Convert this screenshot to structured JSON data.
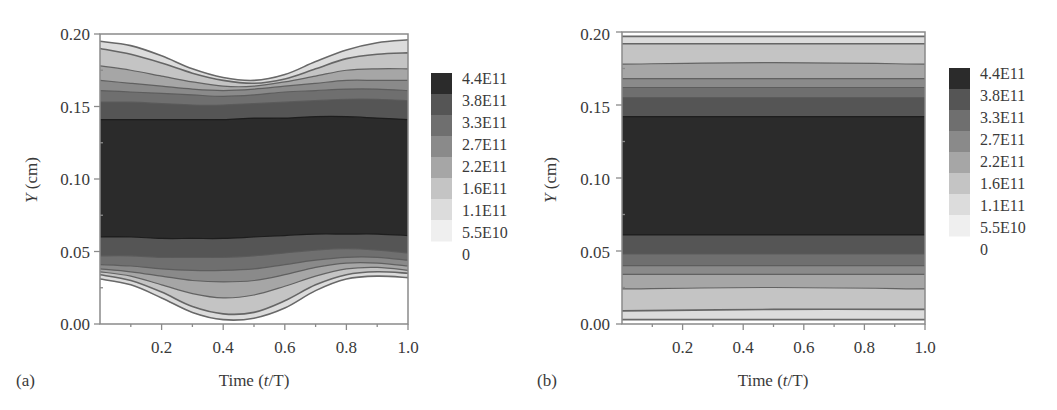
{
  "chart_data": [
    {
      "panel": "(a)",
      "type": "heatmap",
      "subtype": "filled-contour",
      "xlabel": "Time (t/T)",
      "ylabel": "Y (cm)",
      "xlim": [
        0.0,
        1.0
      ],
      "ylim": [
        0.0,
        0.2
      ],
      "xticks": [
        "0.2",
        "0.4",
        "0.6",
        "0.8",
        "1.0"
      ],
      "yticks": [
        "0.00",
        "0.05",
        "0.10",
        "0.15",
        "0.20"
      ],
      "colorbar": {
        "levels": [
          "4.4E11",
          "3.8E11",
          "3.3E11",
          "2.7E11",
          "2.2E11",
          "1.6E11",
          "1.1E11",
          "5.5E10",
          "0"
        ],
        "level_values": [
          440000000000.0,
          380000000000.0,
          330000000000.0,
          270000000000.0,
          220000000000.0,
          160000000000.0,
          110000000000.0,
          55000000000.0,
          0
        ]
      },
      "description": "Oscillating channel: dark core (>=3.8E11) between Y~0.06 and Y~0.14; outer contour bands bend toward the walls, dipping to Y~0.17 at top and Y~0.005 at bottom near t/T~0.45, rising back near t/T~0.9-1.0",
      "x": [
        0.0,
        0.1,
        0.2,
        0.3,
        0.4,
        0.5,
        0.6,
        0.7,
        0.8,
        0.9,
        1.0
      ],
      "contours_upper": [
        {
          "level": "3.8E11",
          "y": [
            0.141,
            0.141,
            0.141,
            0.141,
            0.141,
            0.142,
            0.142,
            0.143,
            0.143,
            0.142,
            0.141
          ]
        },
        {
          "level": "3.3E11",
          "y": [
            0.153,
            0.153,
            0.152,
            0.151,
            0.151,
            0.152,
            0.153,
            0.154,
            0.155,
            0.155,
            0.154
          ]
        },
        {
          "level": "2.7E11",
          "y": [
            0.161,
            0.16,
            0.159,
            0.158,
            0.157,
            0.158,
            0.16,
            0.161,
            0.162,
            0.162,
            0.161
          ]
        },
        {
          "level": "2.2E11",
          "y": [
            0.168,
            0.166,
            0.164,
            0.162,
            0.161,
            0.162,
            0.164,
            0.166,
            0.168,
            0.168,
            0.168
          ]
        },
        {
          "level": "1.6E11",
          "y": [
            0.178,
            0.175,
            0.171,
            0.167,
            0.164,
            0.164,
            0.167,
            0.171,
            0.175,
            0.176,
            0.176
          ]
        },
        {
          "level": "1.1E11",
          "y": [
            0.19,
            0.186,
            0.18,
            0.173,
            0.168,
            0.166,
            0.169,
            0.176,
            0.183,
            0.186,
            0.187
          ]
        },
        {
          "level": "5.5E10",
          "y": [
            0.195,
            0.192,
            0.185,
            0.176,
            0.17,
            0.168,
            0.172,
            0.181,
            0.189,
            0.194,
            0.196
          ]
        }
      ],
      "contours_lower": [
        {
          "level": "3.8E11",
          "y": [
            0.06,
            0.06,
            0.059,
            0.059,
            0.059,
            0.06,
            0.061,
            0.062,
            0.062,
            0.062,
            0.061
          ]
        },
        {
          "level": "3.3E11",
          "y": [
            0.047,
            0.047,
            0.046,
            0.046,
            0.046,
            0.047,
            0.049,
            0.051,
            0.052,
            0.051,
            0.049
          ]
        },
        {
          "level": "2.7E11",
          "y": [
            0.041,
            0.04,
            0.038,
            0.037,
            0.037,
            0.038,
            0.041,
            0.044,
            0.046,
            0.046,
            0.044
          ]
        },
        {
          "level": "2.2E11",
          "y": [
            0.038,
            0.036,
            0.033,
            0.03,
            0.029,
            0.03,
            0.034,
            0.039,
            0.042,
            0.042,
            0.04
          ]
        },
        {
          "level": "1.6E11",
          "y": [
            0.036,
            0.033,
            0.027,
            0.021,
            0.018,
            0.02,
            0.026,
            0.033,
            0.038,
            0.039,
            0.037
          ]
        },
        {
          "level": "1.1E11",
          "y": [
            0.034,
            0.03,
            0.022,
            0.012,
            0.007,
            0.008,
            0.016,
            0.027,
            0.034,
            0.036,
            0.035
          ]
        },
        {
          "level": "5.5E10",
          "y": [
            0.031,
            0.027,
            0.018,
            0.008,
            0.003,
            0.004,
            0.011,
            0.023,
            0.031,
            0.033,
            0.032
          ]
        }
      ]
    },
    {
      "panel": "(b)",
      "type": "heatmap",
      "subtype": "filled-contour",
      "xlabel": "Time (t/T)",
      "ylabel": "Y (cm)",
      "xlim": [
        0.0,
        1.0
      ],
      "ylim": [
        0.0,
        0.2
      ],
      "xticks": [
        "0.2",
        "0.4",
        "0.6",
        "0.8",
        "1.0"
      ],
      "yticks": [
        "0.00",
        "0.05",
        "0.10",
        "0.15",
        "0.20"
      ],
      "colorbar": {
        "levels": [
          "4.4E11",
          "3.8E11",
          "3.3E11",
          "2.7E11",
          "2.2E11",
          "1.6E11",
          "1.1E11",
          "5.5E10",
          "0"
        ],
        "level_values": [
          440000000000.0,
          380000000000.0,
          330000000000.0,
          270000000000.0,
          220000000000.0,
          160000000000.0,
          110000000000.0,
          55000000000.0,
          0
        ]
      },
      "description": "Steady channel: horizontal bands; dark core (>=3.8E11) between Y~0.06 and Y~0.142; bands nearly flat in time",
      "x": [
        0.0,
        0.5,
        1.0
      ],
      "contours_upper": [
        {
          "level": "3.8E11",
          "y": [
            0.142,
            0.142,
            0.142
          ]
        },
        {
          "level": "3.3E11",
          "y": [
            0.155,
            0.155,
            0.155
          ]
        },
        {
          "level": "2.7E11",
          "y": [
            0.162,
            0.162,
            0.162
          ]
        },
        {
          "level": "2.2E11",
          "y": [
            0.168,
            0.168,
            0.168
          ]
        },
        {
          "level": "1.6E11",
          "y": [
            0.178,
            0.179,
            0.178
          ]
        },
        {
          "level": "1.1E11",
          "y": [
            0.192,
            0.192,
            0.192
          ]
        },
        {
          "level": "5.5E10",
          "y": [
            0.197,
            0.197,
            0.197
          ]
        }
      ],
      "contours_lower": [
        {
          "level": "3.8E11",
          "y": [
            0.061,
            0.061,
            0.061
          ]
        },
        {
          "level": "3.3E11",
          "y": [
            0.048,
            0.048,
            0.048
          ]
        },
        {
          "level": "2.7E11",
          "y": [
            0.04,
            0.04,
            0.04
          ]
        },
        {
          "level": "2.2E11",
          "y": [
            0.034,
            0.034,
            0.034
          ]
        },
        {
          "level": "1.6E11",
          "y": [
            0.024,
            0.025,
            0.024
          ]
        },
        {
          "level": "1.1E11",
          "y": [
            0.009,
            0.01,
            0.01
          ]
        },
        {
          "level": "5.5E10",
          "y": [
            0.003,
            0.003,
            0.003
          ]
        }
      ]
    }
  ],
  "panels": [
    {
      "label": "(a)",
      "xlabel_prefix": "Time (",
      "xlabel_var": "t",
      "xlabel_suffix": "/T)",
      "ylabel_var": "Y",
      "ylabel_suffix": " (cm)",
      "xticks": [
        "0.2",
        "0.4",
        "0.6",
        "0.8",
        "1.0"
      ],
      "yticks": [
        "0.00",
        "0.05",
        "0.10",
        "0.15",
        "0.20"
      ],
      "colorbar_labels": [
        "4.4E11",
        "3.8E11",
        "3.3E11",
        "2.7E11",
        "2.2E11",
        "1.6E11",
        "1.1E11",
        "5.5E10",
        "0"
      ]
    },
    {
      "label": "(b)",
      "xlabel_prefix": "Time (",
      "xlabel_var": "t",
      "xlabel_suffix": "/T)",
      "ylabel_var": "Y",
      "ylabel_suffix": " (cm)",
      "xticks": [
        "0.2",
        "0.4",
        "0.6",
        "0.8",
        "1.0"
      ],
      "yticks": [
        "0.00",
        "0.05",
        "0.10",
        "0.15",
        "0.20"
      ],
      "colorbar_labels": [
        "4.4E11",
        "3.8E11",
        "3.3E11",
        "2.7E11",
        "2.2E11",
        "1.6E11",
        "1.1E11",
        "5.5E10",
        "0"
      ]
    }
  ],
  "colors": {
    "band_fills": [
      "#2b2b2b",
      "#555555",
      "#6f6f6f",
      "#8a8a8a",
      "#a6a6a6",
      "#c4c4c4",
      "#dcdcdc",
      "#efefef"
    ],
    "contour_line": "#5a5a5a",
    "axis": "#8a8a8a",
    "text": "#3a3a3a"
  }
}
